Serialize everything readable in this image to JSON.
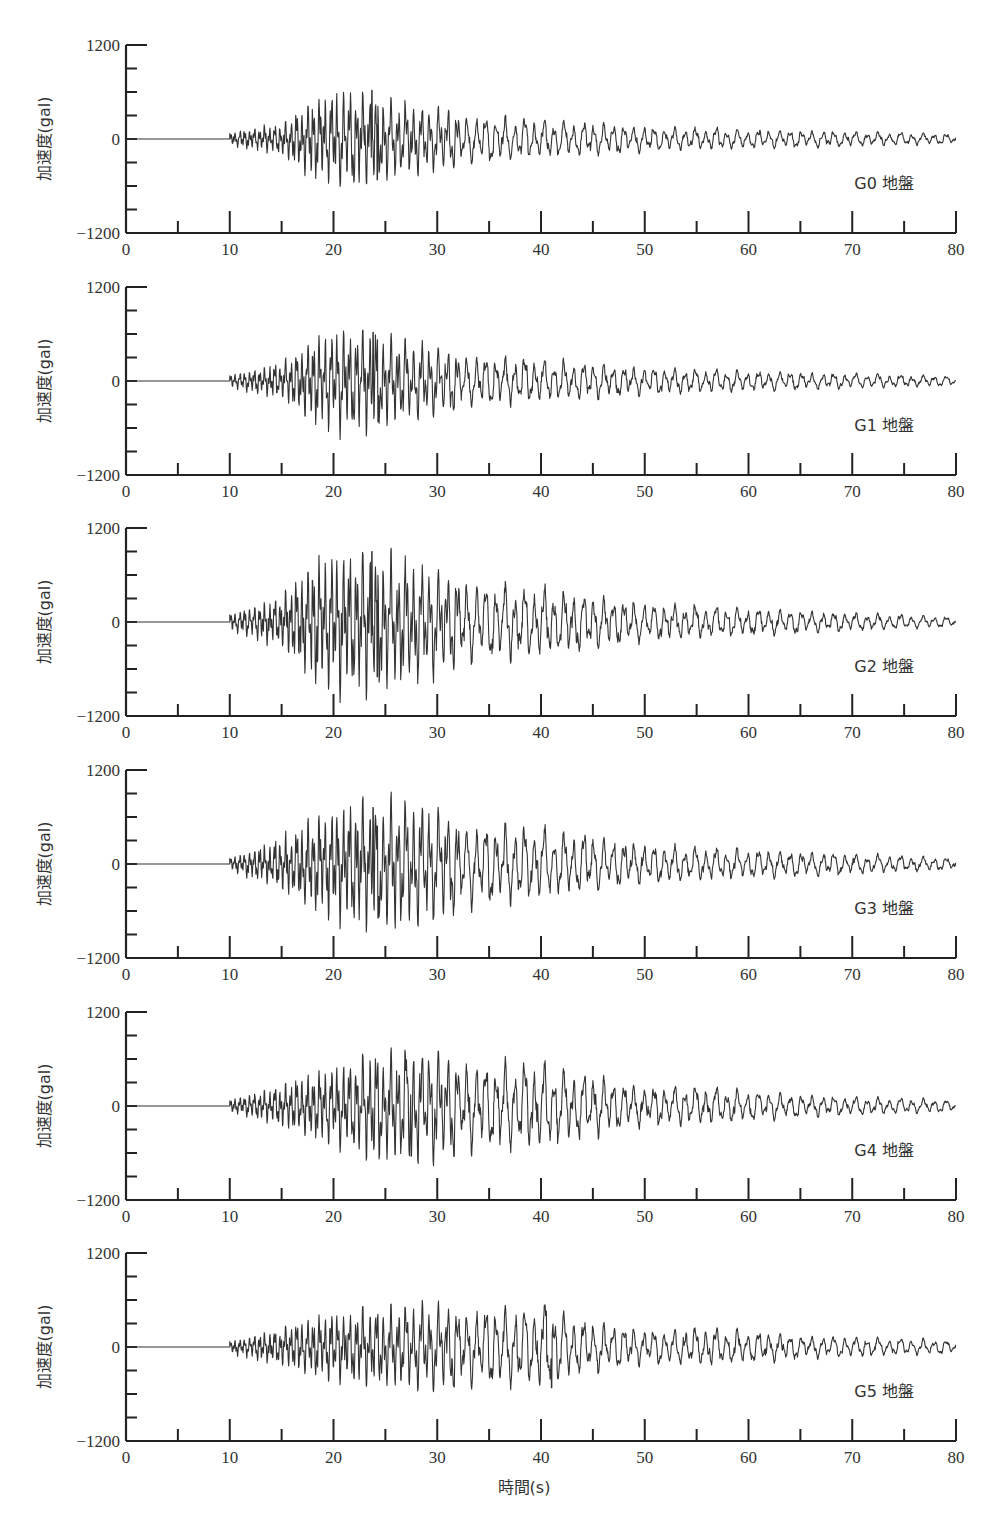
{
  "figure": {
    "x_axis_title": "時間(s)",
    "y_axis_title": "加速度(gal)"
  },
  "chart_data": {
    "type": "line",
    "title": "",
    "xlabel": "時間(s)",
    "ylabel": "加速度(gal)",
    "xlim": [
      0,
      80
    ],
    "ylim": [
      -1200,
      1200
    ],
    "x_ticks": [
      0,
      10,
      20,
      30,
      40,
      50,
      60,
      70,
      80
    ],
    "x_minor_ticks": [
      5,
      15,
      25,
      35,
      45,
      55,
      65,
      75
    ],
    "y_tick_labels": [
      "1200",
      "0",
      "-1200"
    ],
    "y_minor_tick_step": 300,
    "grid": false,
    "series": [
      {
        "name": "G0 地盤",
        "onset_s": 10,
        "peak_time_s": 23.7,
        "peak_pos_gal": 620,
        "peak_neg_gal": -520,
        "envelope_gal": [
          [
            10,
            60
          ],
          [
            15,
            150
          ],
          [
            18,
            380
          ],
          [
            22,
            480
          ],
          [
            24,
            420
          ],
          [
            30,
            300
          ],
          [
            40,
            230
          ],
          [
            50,
            150
          ],
          [
            60,
            110
          ],
          [
            70,
            90
          ],
          [
            80,
            60
          ]
        ]
      },
      {
        "name": "G1 地盤",
        "onset_s": 10,
        "peak_time_s": 23.8,
        "peak_pos_gal": 620,
        "peak_neg_gal": -520,
        "envelope_gal": [
          [
            10,
            60
          ],
          [
            15,
            170
          ],
          [
            18,
            420
          ],
          [
            22,
            500
          ],
          [
            24,
            450
          ],
          [
            30,
            330
          ],
          [
            40,
            250
          ],
          [
            50,
            160
          ],
          [
            60,
            120
          ],
          [
            70,
            90
          ],
          [
            80,
            60
          ]
        ]
      },
      {
        "name": "G2 地盤",
        "onset_s": 10,
        "peak_time_s": 23.7,
        "peak_pos_gal": 900,
        "peak_neg_gal": -700,
        "envelope_gal": [
          [
            10,
            80
          ],
          [
            15,
            250
          ],
          [
            18,
            600
          ],
          [
            22,
            700
          ],
          [
            25,
            650
          ],
          [
            30,
            500
          ],
          [
            40,
            400
          ],
          [
            50,
            220
          ],
          [
            60,
            160
          ],
          [
            70,
            110
          ],
          [
            80,
            60
          ]
        ]
      },
      {
        "name": "G3 地盤",
        "onset_s": 10,
        "peak_time_s": 23.8,
        "peak_pos_gal": 720,
        "peak_neg_gal": -690,
        "envelope_gal": [
          [
            10,
            60
          ],
          [
            15,
            250
          ],
          [
            18,
            450
          ],
          [
            22,
            600
          ],
          [
            27,
            620
          ],
          [
            32,
            500
          ],
          [
            40,
            420
          ],
          [
            50,
            230
          ],
          [
            60,
            170
          ],
          [
            70,
            120
          ],
          [
            80,
            70
          ]
        ]
      },
      {
        "name": "G4 地盤",
        "onset_s": 10,
        "peak_time_s": 27,
        "peak_pos_gal": 590,
        "peak_neg_gal": -640,
        "envelope_gal": [
          [
            10,
            60
          ],
          [
            15,
            200
          ],
          [
            20,
            380
          ],
          [
            24,
            520
          ],
          [
            28,
            560
          ],
          [
            34,
            500
          ],
          [
            40,
            500
          ],
          [
            50,
            220
          ],
          [
            56,
            230
          ],
          [
            65,
            130
          ],
          [
            80,
            70
          ]
        ]
      },
      {
        "name": "G5 地盤",
        "onset_s": 10,
        "peak_time_s": 40.5,
        "peak_pos_gal": 460,
        "peak_neg_gal": -520,
        "envelope_gal": [
          [
            10,
            60
          ],
          [
            15,
            180
          ],
          [
            20,
            330
          ],
          [
            25,
            380
          ],
          [
            30,
            420
          ],
          [
            35,
            450
          ],
          [
            40,
            480
          ],
          [
            45,
            300
          ],
          [
            50,
            200
          ],
          [
            56,
            230
          ],
          [
            65,
            140
          ],
          [
            80,
            80
          ]
        ]
      }
    ]
  }
}
